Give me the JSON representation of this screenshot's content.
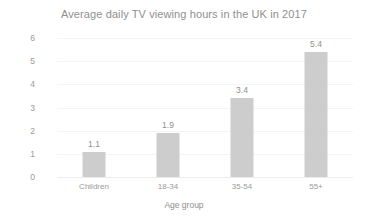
{
  "chart_data": {
    "type": "bar",
    "title": "Average daily TV viewing hours in the UK in 2017",
    "xlabel": "Age group",
    "ylabel": "Viewing hours per day",
    "categories": [
      "Children",
      "18-34",
      "35-54",
      "55+"
    ],
    "values": [
      1.1,
      1.9,
      3.4,
      5.4
    ],
    "value_labels": [
      "1.1",
      "1.9",
      "3.4",
      "5.4"
    ],
    "ylim": [
      0,
      6
    ],
    "yticks": [
      6,
      5,
      4,
      3,
      2,
      1,
      0
    ],
    "ytick_labels": [
      "6",
      "5",
      "4",
      "3",
      "2",
      "1",
      "0"
    ],
    "grid": true,
    "legend": false,
    "bar_color": "#cdcdcd",
    "text_color": "#8f8f8f",
    "background_color": "#ffffff"
  }
}
